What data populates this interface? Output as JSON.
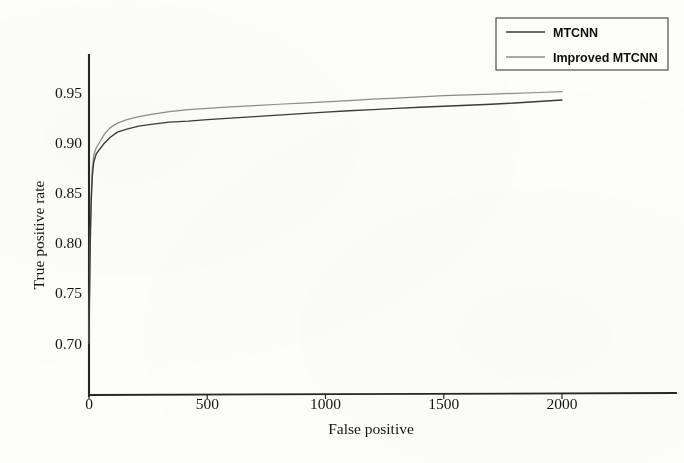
{
  "figure": {
    "background_color": "#fdfdfb",
    "ink_color": "#1a1a1a"
  },
  "axes": {
    "x_title": "False positive",
    "y_title": "True positive rate",
    "x_ticks": [
      "0",
      "500",
      "1000",
      "1500",
      "2000"
    ],
    "y_ticks": [
      "0.95",
      "0.90",
      "0.85",
      "0.80",
      "0.75",
      "0.70"
    ]
  },
  "legend": {
    "position": "top-right",
    "entries": [
      {
        "label": "MTCNN",
        "color": "#3a3a3a"
      },
      {
        "label": "Improved MTCNN",
        "color": "#8d8d8d"
      }
    ]
  },
  "chart_data": {
    "type": "line",
    "title": "",
    "subtitle": "",
    "xlabel": "False positive",
    "ylabel": "True positive rate",
    "xlim": [
      0,
      2140
    ],
    "ylim": [
      0.675,
      0.962
    ],
    "xticks": [
      0,
      500,
      1000,
      1500,
      2000
    ],
    "yticks": [
      0.7,
      0.75,
      0.8,
      0.85,
      0.9,
      0.95
    ],
    "grid": false,
    "legend_position": "top-right",
    "series": [
      {
        "name": "MTCNN",
        "color": "#3a3a3a",
        "x": [
          0,
          2,
          5,
          9,
          14,
          20,
          30,
          45,
          65,
          90,
          120,
          160,
          210,
          270,
          340,
          420,
          500,
          600,
          700,
          800,
          900,
          1000,
          1100,
          1200,
          1300,
          1400,
          1500,
          1600,
          1700,
          1800,
          1900,
          2000
        ],
        "y": [
          0.7,
          0.742,
          0.795,
          0.838,
          0.866,
          0.88,
          0.888,
          0.893,
          0.899,
          0.905,
          0.91,
          0.913,
          0.916,
          0.918,
          0.92,
          0.921,
          0.9225,
          0.924,
          0.9255,
          0.927,
          0.9285,
          0.93,
          0.9313,
          0.9325,
          0.9337,
          0.9348,
          0.9358,
          0.9368,
          0.9378,
          0.939,
          0.9405,
          0.942
        ]
      },
      {
        "name": "Improved MTCNN",
        "color": "#8d8d8d",
        "x": [
          0,
          2,
          5,
          9,
          14,
          20,
          30,
          45,
          65,
          90,
          120,
          160,
          210,
          270,
          340,
          420,
          500,
          600,
          700,
          800,
          900,
          1000,
          1100,
          1200,
          1300,
          1400,
          1500,
          1600,
          1700,
          1800,
          1900,
          2000
        ],
        "y": [
          0.7,
          0.748,
          0.802,
          0.846,
          0.874,
          0.887,
          0.894,
          0.9,
          0.908,
          0.9145,
          0.919,
          0.9225,
          0.9255,
          0.928,
          0.9305,
          0.9325,
          0.9338,
          0.9352,
          0.9365,
          0.9378,
          0.939,
          0.9402,
          0.9415,
          0.9428,
          0.944,
          0.9452,
          0.9463,
          0.9472,
          0.948,
          0.9487,
          0.9495,
          0.9503
        ]
      }
    ]
  }
}
